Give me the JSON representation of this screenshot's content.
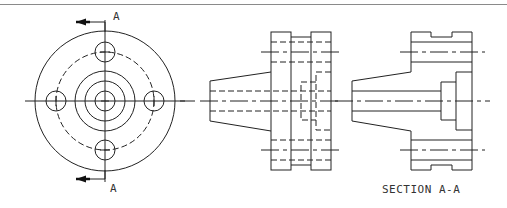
{
  "drawing": {
    "type": "orthographic-engineering-drawing",
    "views": [
      {
        "id": "front-view",
        "description": "Circular flange face view with four bolt holes"
      },
      {
        "id": "side-view",
        "description": "Side elevation with hidden lines"
      },
      {
        "id": "section-view",
        "description": "Sectioned side view along A-A with hatching"
      }
    ],
    "cutting_plane": {
      "label_top": "A",
      "label_bottom": "A"
    },
    "section_title": "SECTION A-A",
    "colors": {
      "line": "#222222",
      "background": "#ffffff",
      "border": "#8a8a8a"
    }
  }
}
